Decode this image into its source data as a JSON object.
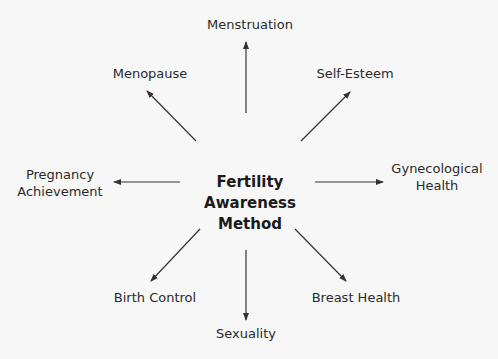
{
  "center": {
    "line1": "Fertility",
    "line2": "Awareness",
    "line3": "Method"
  },
  "nodes": {
    "top": "Menstruation",
    "top_left": "Menopause",
    "top_right": "Self-Esteem",
    "left": {
      "line1": "Pregnancy",
      "line2": "Achievement"
    },
    "right": {
      "line1": "Gynecological",
      "line2": "Health"
    },
    "bottom_left": "Birth Control",
    "bottom": "Sexuality",
    "bottom_right": "Breast Health"
  },
  "colors": {
    "background": "#f7f7f7",
    "text": "#2a2a2a",
    "arrow": "#333333"
  }
}
